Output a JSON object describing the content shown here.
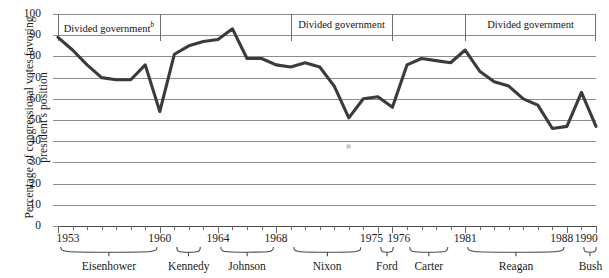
{
  "chart_data": {
    "type": "line",
    "title": "",
    "xlabel": "",
    "ylabel": "Percentage of congressional votes favoring president's position",
    "ylim": [
      0,
      100
    ],
    "xlim": [
      1953,
      1990
    ],
    "ytick_labels": [
      "0",
      "10",
      "20",
      "30",
      "40",
      "50",
      "60",
      "70",
      "80",
      "90",
      "100"
    ],
    "ytick_values": [
      0,
      10,
      20,
      30,
      40,
      50,
      60,
      70,
      80,
      90,
      100
    ],
    "xtick_labels": [
      "1953",
      "1960",
      "1964",
      "1968",
      "1975",
      "1976",
      "1981",
      "1988",
      "1990"
    ],
    "xtick_values": [
      1953,
      1960,
      1964,
      1968,
      1975,
      1976,
      1981,
      1988,
      1990
    ],
    "grid": true,
    "legend": "none",
    "series": [
      {
        "name": "Percentage of congressional votes favoring president's position",
        "x": [
          1953,
          1954,
          1955,
          1956,
          1957,
          1958,
          1959,
          1960,
          1961,
          1962,
          1963,
          1964,
          1965,
          1966,
          1967,
          1968,
          1969,
          1970,
          1971,
          1972,
          1973,
          1974,
          1975,
          1976,
          1977,
          1978,
          1979,
          1980,
          1981,
          1982,
          1983,
          1984,
          1985,
          1986,
          1987,
          1988,
          1989,
          1990
        ],
        "values": [
          89,
          83,
          76,
          70,
          69,
          69,
          76,
          54,
          81,
          85,
          87,
          88,
          93,
          79,
          79,
          76,
          75,
          77,
          75,
          66,
          51,
          60,
          61,
          56,
          76,
          79,
          78,
          77,
          83,
          73,
          68,
          66,
          60,
          57,
          46,
          47,
          63,
          47
        ]
      }
    ],
    "annotations": [
      {
        "label": "Divided government",
        "superscript": "b",
        "start_year": 1953,
        "end_year": 1960
      },
      {
        "label": "Divided government",
        "superscript": "",
        "start_year": 1969,
        "end_year": 1976
      },
      {
        "label": "Divided government",
        "superscript": "",
        "start_year": 1981,
        "end_year": 1990
      }
    ],
    "presidents": [
      {
        "name": "Eisenhower",
        "start_year": 1953,
        "end_year": 1960
      },
      {
        "name": "Kennedy",
        "start_year": 1961,
        "end_year": 1963
      },
      {
        "name": "Johnson",
        "start_year": 1964,
        "end_year": 1968
      },
      {
        "name": "Nixon",
        "start_year": 1969,
        "end_year": 1974
      },
      {
        "name": "Ford",
        "start_year": 1975,
        "end_year": 1976
      },
      {
        "name": "Carter",
        "start_year": 1977,
        "end_year": 1980
      },
      {
        "name": "Reagan",
        "start_year": 1981,
        "end_year": 1988
      },
      {
        "name": "Bush",
        "start_year": 1989,
        "end_year": 1990
      }
    ],
    "colors": {
      "line": "#3b3b3b",
      "grid": "#8c8c8c",
      "axis": "#4a4a4a",
      "text": "#1a1a1a",
      "background": "#ffffff"
    }
  }
}
